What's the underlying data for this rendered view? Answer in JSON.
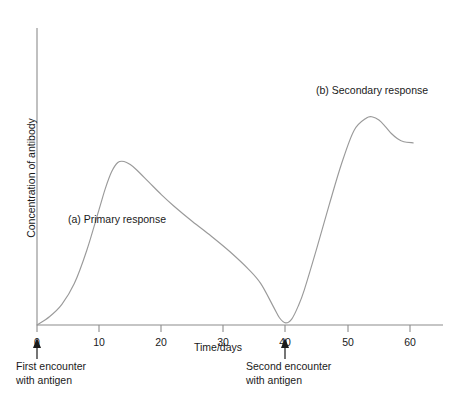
{
  "chart_data": {
    "type": "line",
    "title": "",
    "xlabel": "Time/days",
    "ylabel": "Concentration of antibody",
    "xlim": [
      0,
      65
    ],
    "ylim": [
      0,
      1
    ],
    "grid": false,
    "legend_position": "none",
    "xticks": [
      0,
      10,
      20,
      30,
      40,
      50,
      60
    ],
    "xtick_labels": [
      "0",
      "10",
      "20",
      "30",
      "40",
      "50",
      "60"
    ],
    "yticks": [],
    "ytick_labels": [],
    "series": [
      {
        "name": "Antibody concentration",
        "color": "#9a9a9a",
        "x": [
          0,
          2,
          4,
          6,
          8,
          10,
          11,
          12,
          13,
          14,
          15,
          16,
          18,
          20,
          22,
          25,
          28,
          31,
          34,
          36,
          38,
          39,
          40,
          41,
          42,
          43,
          45,
          47,
          49,
          51,
          53,
          54,
          55,
          56,
          57,
          58,
          59,
          60.5
        ],
        "y": [
          0.0,
          0.04,
          0.1,
          0.2,
          0.36,
          0.56,
          0.66,
          0.74,
          0.785,
          0.79,
          0.775,
          0.75,
          0.69,
          0.63,
          0.575,
          0.5,
          0.43,
          0.355,
          0.27,
          0.2,
          0.09,
          0.035,
          0.01,
          0.03,
          0.09,
          0.17,
          0.37,
          0.58,
          0.78,
          0.94,
          1.0,
          1.005,
          0.99,
          0.96,
          0.925,
          0.9,
          0.885,
          0.88
        ]
      }
    ],
    "annotations": [
      {
        "id": "primary",
        "label": "(a) Primary response",
        "x": 5,
        "y": 0.93
      },
      {
        "id": "secondary",
        "label": "(b) Secondary response",
        "x": 45,
        "y": 1.17
      }
    ],
    "markers": [
      {
        "id": "first-encounter",
        "x": 0,
        "label_line1": "First encounter",
        "label_line2": "with antigen"
      },
      {
        "id": "second-encounter",
        "x": 40,
        "label_line1": "Second encounter",
        "label_line2": "with antigen"
      }
    ]
  },
  "colors": {
    "curve": "#9a9a9a",
    "axis": "#8c8c8c",
    "text": "#1a1a1a",
    "background": "#ffffff"
  }
}
